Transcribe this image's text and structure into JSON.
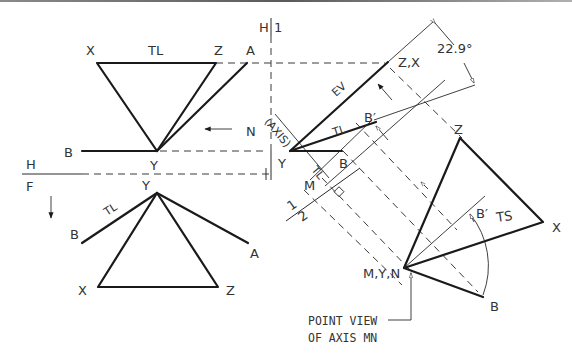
{
  "top_view": {
    "vertex_x": "X",
    "vertex_z": "Z",
    "vertex_a": "A",
    "vertex_b": "B",
    "vertex_y": "Y",
    "true_length_label": "TL",
    "direction_label": "N"
  },
  "fold_lines": {
    "hf_top": "H",
    "hf_bottom": "F",
    "h1_left": "H",
    "h1_right": "1",
    "aux12_1": "1",
    "aux12_2": "2"
  },
  "front_view": {
    "vertex_y": "Y",
    "vertex_b": "B",
    "vertex_a": "A",
    "vertex_x": "X",
    "vertex_z": "Z",
    "true_length_label": "TL"
  },
  "auxiliary_view_1": {
    "vertex_zx": "Z,X",
    "vertex_y": "Y",
    "vertex_b": "B",
    "vertex_b_prime": "B′",
    "vertex_m": "M",
    "axis_label": "(AXIS)",
    "edge_view_label": "EV",
    "true_length_label": "TL",
    "true_length_label_2": "TL",
    "angle": "22.9°"
  },
  "auxiliary_view_2": {
    "vertex_z": "Z",
    "vertex_x": "X",
    "vertex_b": "B",
    "vertex_b_prime": "B′",
    "point_view": "M,Y,N",
    "true_shape_label": "TS",
    "note_line1": "POINT VIEW",
    "note_line2": "OF AXIS MN"
  }
}
